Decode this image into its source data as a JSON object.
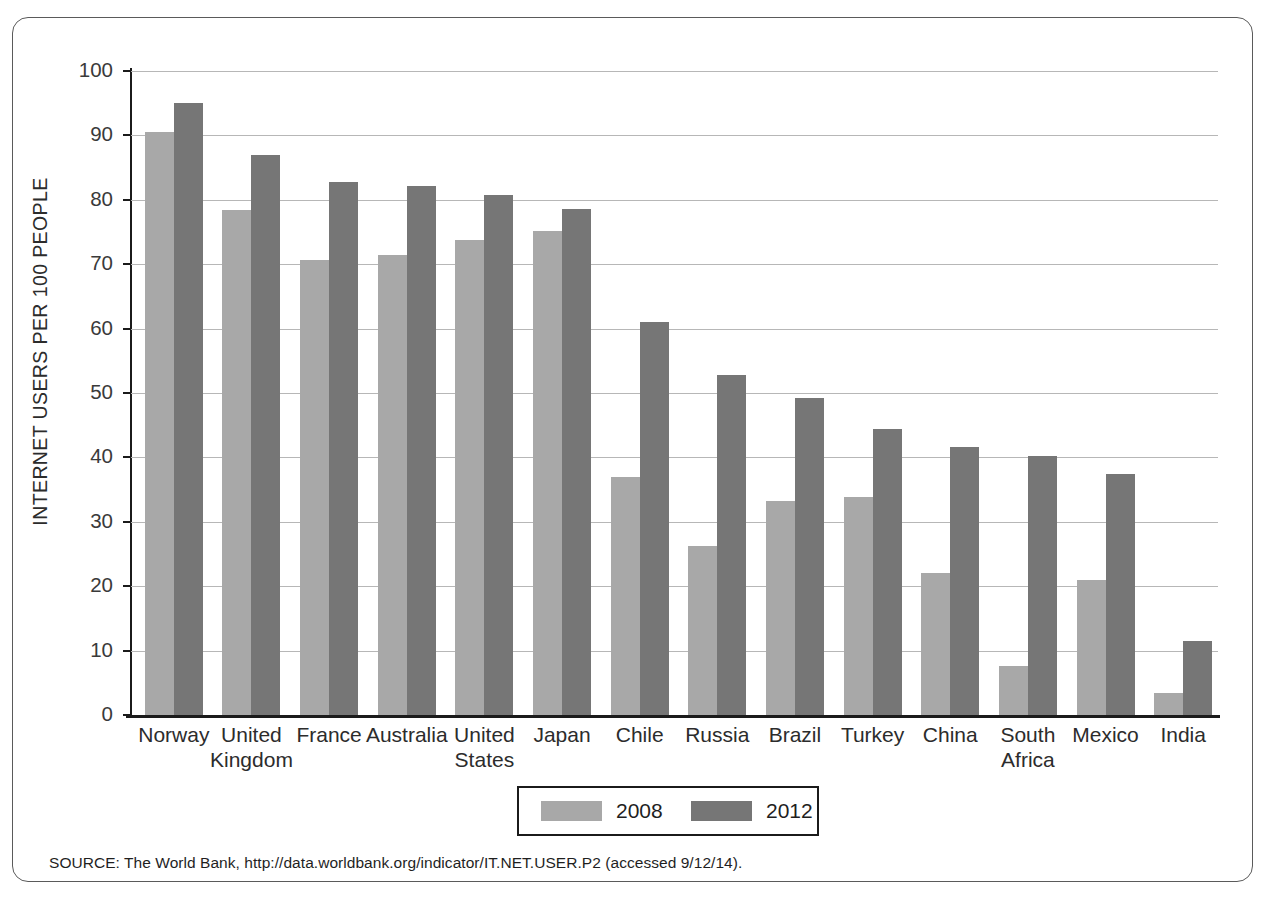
{
  "figure": {
    "y_axis_title": "INTERNET USERS PER 100 PEOPLE",
    "source_note": "SOURCE: The World Bank, http://data.worldbank.org/indicator/IT.NET.USER.P2 (accessed 9/12/14)."
  },
  "legend": {
    "position": "bottom-center",
    "items": [
      {
        "label": "2008",
        "color": "#a8a8a8"
      },
      {
        "label": "2012",
        "color": "#767676"
      }
    ]
  },
  "colors": {
    "series_2008": "#a8a8a8",
    "series_2012": "#767676",
    "gridline": "#b7b7b7",
    "axis": "#1b1b1b",
    "frame": "#5a5a5a"
  },
  "chart_data": {
    "type": "bar",
    "title": "",
    "xlabel": "",
    "ylabel": "INTERNET USERS PER 100 PEOPLE",
    "ylim": [
      0,
      100
    ],
    "ytick_step": 10,
    "yticks": [
      0,
      10,
      20,
      30,
      40,
      50,
      60,
      70,
      80,
      90,
      100
    ],
    "ytick_labels": [
      "0",
      "10",
      "20",
      "30",
      "40",
      "50",
      "60",
      "70",
      "80",
      "90",
      "100"
    ],
    "grid": true,
    "grid_axis": "y",
    "legend": [
      "2008",
      "2012"
    ],
    "categories": [
      "Norway",
      "United\nKingdom",
      "France",
      "Australia",
      "United\nStates",
      "Japan",
      "Chile",
      "Russia",
      "Brazil",
      "Turkey",
      "China",
      "South\nAfrica",
      "Mexico",
      "India"
    ],
    "series": [
      {
        "name": "2008",
        "color": "#a8a8a8",
        "values": [
          90.5,
          78.4,
          70.6,
          71.5,
          73.8,
          75.2,
          36.9,
          26.3,
          33.3,
          33.8,
          22.0,
          7.6,
          21.0,
          3.4
        ]
      },
      {
        "name": "2012",
        "color": "#767676",
        "values": [
          95.0,
          87.0,
          82.8,
          82.2,
          80.8,
          78.6,
          61.0,
          52.8,
          49.2,
          44.4,
          41.6,
          40.2,
          37.5,
          11.5
        ]
      }
    ]
  }
}
